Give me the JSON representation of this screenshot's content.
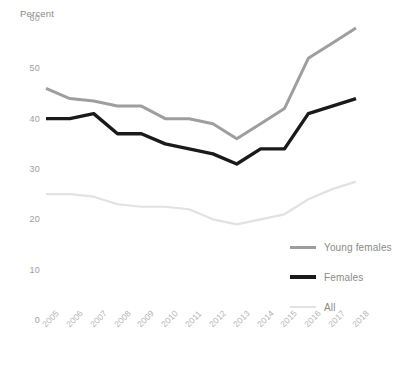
{
  "chart_data": {
    "type": "line",
    "title": "",
    "subtitle": "",
    "xlabel": "",
    "ylabel": "Percent",
    "ylim": [
      0,
      60
    ],
    "yticks": [
      0,
      10,
      20,
      30,
      40,
      50,
      60
    ],
    "grid": false,
    "legend_position": "right-inside",
    "categories": [
      "2005",
      "2006",
      "2007",
      "2008",
      "2009",
      "2010",
      "2011",
      "2012",
      "2013",
      "2014",
      "2015",
      "2016",
      "2017",
      "2018"
    ],
    "series": [
      {
        "name": "Young females",
        "color": "#9e9e9e",
        "values": [
          46,
          44,
          43.5,
          42.5,
          42.5,
          40,
          40,
          39,
          36,
          39,
          42,
          52,
          55,
          58
        ]
      },
      {
        "name": "Females",
        "color": "#1a1a1a",
        "values": [
          40,
          40,
          41,
          37,
          37,
          35,
          34,
          33,
          31,
          34,
          34,
          41,
          42.5,
          44
        ]
      },
      {
        "name": "All",
        "color": "#e2e2e2",
        "values": [
          25,
          25,
          24.5,
          23,
          22.5,
          22.5,
          22,
          20,
          19,
          20,
          21,
          24,
          26,
          27.5
        ]
      }
    ]
  },
  "legend": {
    "items": [
      {
        "label": "Young females",
        "color": "#9e9e9e",
        "weight": "medium"
      },
      {
        "label": "Females",
        "color": "#1a1a1a",
        "weight": "thick"
      },
      {
        "label": "All",
        "color": "#e2e2e2",
        "weight": "thin"
      }
    ]
  }
}
